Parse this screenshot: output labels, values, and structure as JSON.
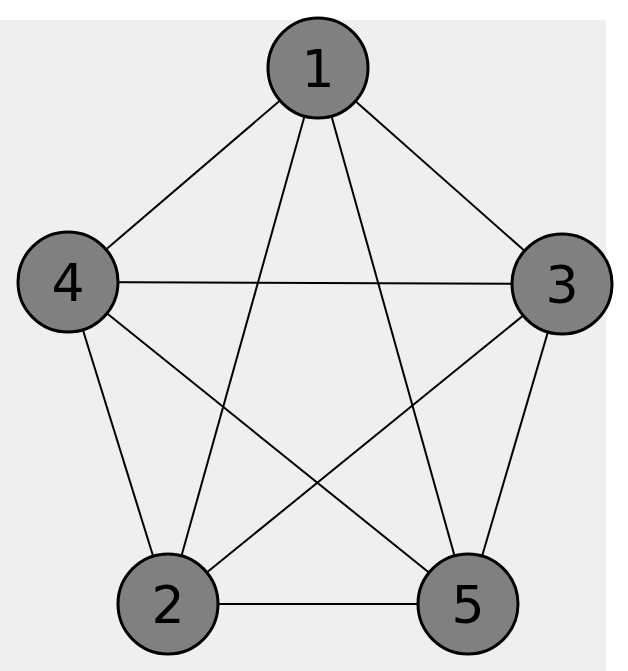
{
  "diagram": {
    "type": "complete-graph",
    "name": "K5",
    "colors": {
      "background_page": "#ffffff",
      "background_panel": "#efefef",
      "node_fill": "#808080",
      "node_stroke": "#000000",
      "edge_stroke": "#000000",
      "label": "#000000"
    },
    "nodes": [
      {
        "id": "1",
        "label": "1",
        "x": 318,
        "y": 68
      },
      {
        "id": "2",
        "label": "2",
        "x": 168,
        "y": 604
      },
      {
        "id": "3",
        "label": "3",
        "x": 562,
        "y": 284
      },
      {
        "id": "4",
        "label": "4",
        "x": 68,
        "y": 282
      },
      {
        "id": "5",
        "label": "5",
        "x": 468,
        "y": 604
      }
    ],
    "edges": [
      [
        "1",
        "2"
      ],
      [
        "1",
        "3"
      ],
      [
        "1",
        "4"
      ],
      [
        "1",
        "5"
      ],
      [
        "2",
        "3"
      ],
      [
        "2",
        "4"
      ],
      [
        "2",
        "5"
      ],
      [
        "3",
        "4"
      ],
      [
        "3",
        "5"
      ],
      [
        "4",
        "5"
      ]
    ]
  }
}
